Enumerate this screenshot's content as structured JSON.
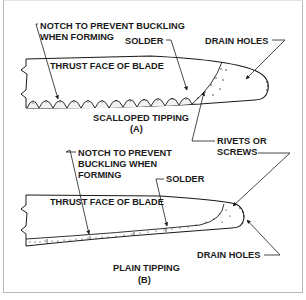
{
  "figure_a": {
    "notch_label_line1": "NOTCH TO PREVENT BUCKLING",
    "notch_label_line2": "WHEN FORMING",
    "solder_label": "SOLDER",
    "drain_holes_label": "DRAIN HOLES",
    "blade_label": "THRUST FACE OF BLADE",
    "caption_line1": "SCALLOPED TIPPING",
    "caption_line2": "(A)"
  },
  "shared": {
    "rivets_label_line1": "RIVETS OR",
    "rivets_label_line2": "SCREWS"
  },
  "figure_b": {
    "notch_label_line1": "NOTCH TO PREVENT",
    "notch_label_line2": "BUCKLING WHEN",
    "notch_label_line3": "FORMING",
    "solder_label": "SOLDER",
    "blade_label": "THRUST  FACE OF  BLADE",
    "drain_holes_label": "DRAIN HOLES",
    "caption_line1": "PLAIN TIPPING",
    "caption_line2": "(B)"
  },
  "colors": {
    "ink": "#1a1a1a",
    "frame": "#b9b9b9",
    "background": "#ffffff"
  }
}
